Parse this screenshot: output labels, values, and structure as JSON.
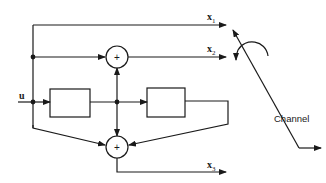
{
  "diagram": {
    "type": "block-diagram",
    "input": {
      "label": "u"
    },
    "outputs": [
      {
        "label": "x",
        "subscript": "1"
      },
      {
        "label": "x",
        "subscript": "2"
      },
      {
        "label": "x",
        "subscript": "3"
      }
    ],
    "adders": [
      {
        "id": "adder-top",
        "symbol": "+"
      },
      {
        "id": "adder-bottom",
        "symbol": "+"
      }
    ],
    "blocks": [
      {
        "id": "delay-1",
        "label": ""
      },
      {
        "id": "delay-2",
        "label": ""
      }
    ],
    "switch": {
      "label": "Channel"
    },
    "colors": {
      "stroke": "#1a1a1a",
      "background": "#ffffff"
    }
  }
}
